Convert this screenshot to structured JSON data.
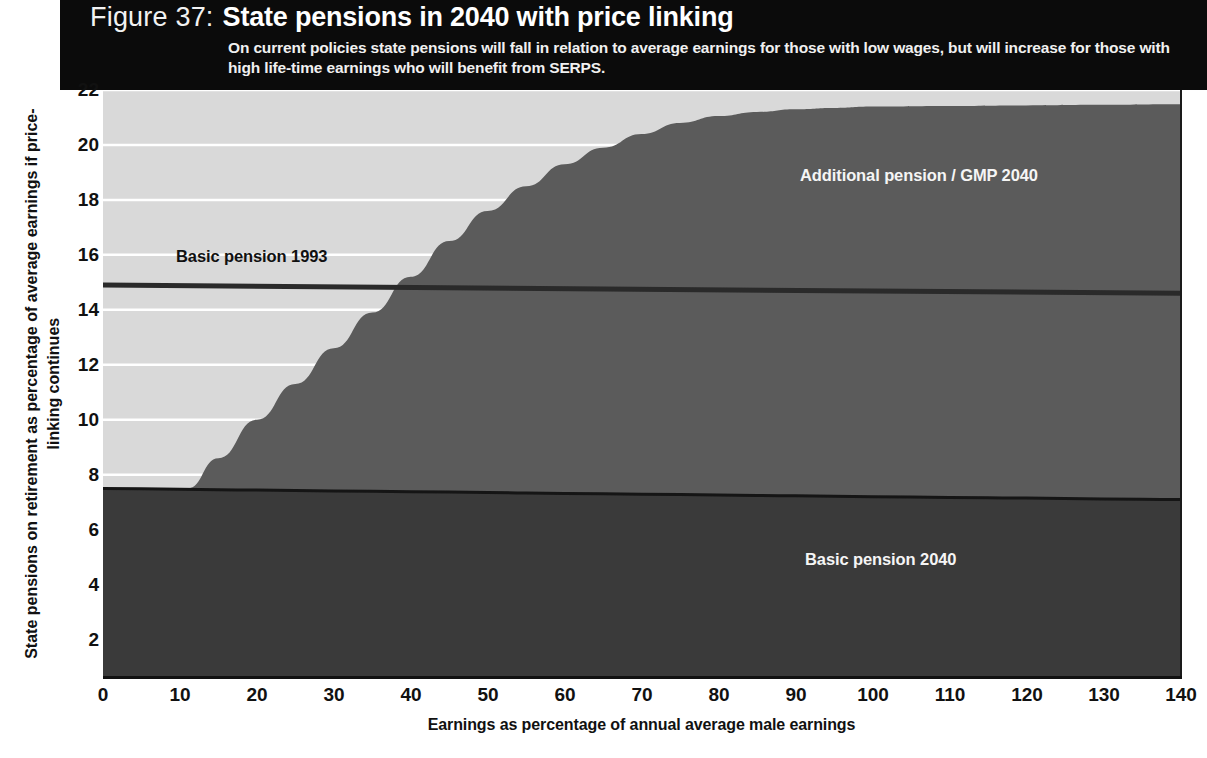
{
  "banner": {
    "figure_number": "Figure 37:",
    "title": "State pensions in 2040 with price linking",
    "subtitle": "On current policies state pensions will fall in relation to average earnings for those with low wages, but will increase for those with high life-time earnings who will benefit from SERPS."
  },
  "axes": {
    "xlabel": "Earnings as percentage of annual average male earnings",
    "ylabel": "State pensions on retirement as percentage of average earnings if price-linking continues"
  },
  "labels": {
    "basic_1993": "Basic pension 1993",
    "additional_2040": "Additional pension / GMP 2040",
    "basic_2040": "Basic pension 2040"
  },
  "colors": {
    "banner_bg": "#0b0b0b",
    "band_background": "#d9d9d9",
    "additional_pension": "#5b5b5b",
    "basic_pension_2040": "#3a3a3a",
    "gridline": "#ffffff",
    "axis": "#111111"
  },
  "chart_data": {
    "type": "area",
    "title": "State pensions in 2040 with price linking",
    "xlabel": "Earnings as percentage of annual average male earnings",
    "ylabel": "State pensions on retirement as percentage of average earnings if price-linking continues",
    "xlim": [
      0,
      140
    ],
    "ylim": [
      0.6,
      22
    ],
    "xticks": [
      0,
      10,
      20,
      30,
      40,
      50,
      60,
      70,
      80,
      90,
      100,
      110,
      120,
      130,
      140
    ],
    "yticks": [
      2,
      4,
      6,
      8,
      10,
      12,
      14,
      16,
      18,
      20,
      22
    ],
    "grid": "horizontal-white-gridlines-in-upper-band",
    "legend": "in-plot annotations",
    "series": [
      {
        "name": "Basic pension 2040",
        "kind": "area-from-zero",
        "color": "#3a3a3a",
        "x": [
          0,
          10,
          20,
          30,
          40,
          50,
          60,
          70,
          80,
          90,
          100,
          110,
          120,
          130,
          140
        ],
        "values": [
          7.5,
          7.47,
          7.44,
          7.41,
          7.38,
          7.35,
          7.32,
          7.29,
          7.26,
          7.23,
          7.2,
          7.17,
          7.15,
          7.12,
          7.1
        ]
      },
      {
        "name": "Additional pension / GMP 2040",
        "kind": "stacked-area-top",
        "color": "#5b5b5b",
        "x": [
          0,
          5,
          10,
          11,
          15,
          20,
          25,
          30,
          35,
          40,
          45,
          50,
          55,
          60,
          65,
          70,
          75,
          80,
          85,
          90,
          95,
          100,
          110,
          120,
          130,
          140
        ],
        "values": [
          7.5,
          7.5,
          7.5,
          7.5,
          8.6,
          10.0,
          11.3,
          12.6,
          13.9,
          15.2,
          16.5,
          17.6,
          18.5,
          19.3,
          19.9,
          20.4,
          20.8,
          21.05,
          21.2,
          21.3,
          21.35,
          21.4,
          21.42,
          21.44,
          21.46,
          21.48
        ]
      },
      {
        "name": "Basic pension 1993",
        "kind": "line",
        "color": "#2a2a2a",
        "x": [
          0,
          140
        ],
        "values": [
          14.9,
          14.6
        ]
      }
    ]
  }
}
